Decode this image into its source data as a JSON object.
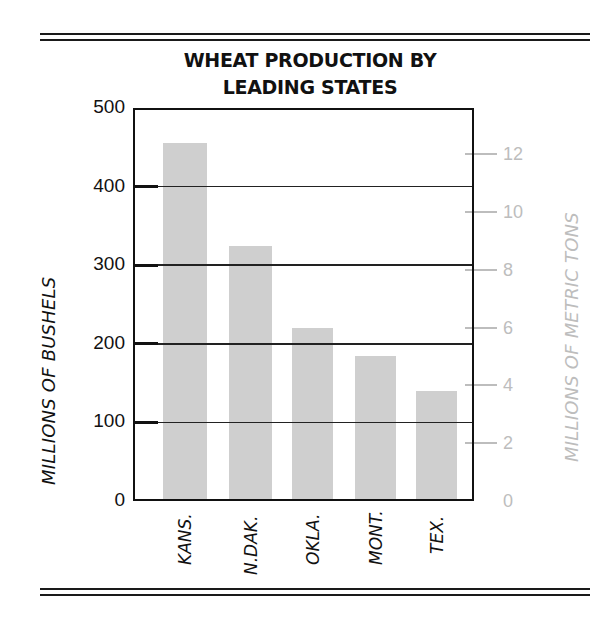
{
  "chart_data": {
    "type": "bar",
    "title": "WHEAT PRODUCTION BY LEADING STATES",
    "title_lines": [
      "WHEAT PRODUCTION BY",
      "LEADING STATES"
    ],
    "categories": [
      "KANS.",
      "N.DAK.",
      "OKLA.",
      "MONT.",
      "TEX."
    ],
    "values": [
      455,
      325,
      220,
      185,
      140
    ],
    "xlabel": "",
    "ylabel": "MILLIONS OF BUSHELS",
    "ylim": [
      0,
      500
    ],
    "yticks": [
      "0",
      "100",
      "200",
      "300",
      "400",
      "500"
    ],
    "y2label": "MILLIONS OF METRIC TONS",
    "y2lim": [
      0,
      13.6
    ],
    "y2ticks": [
      "0",
      "2",
      "4",
      "6",
      "8",
      "10",
      "12"
    ],
    "grid": true,
    "bar_color": "#cfcfcf",
    "secondary_axis_color": "#bdbdbd"
  }
}
